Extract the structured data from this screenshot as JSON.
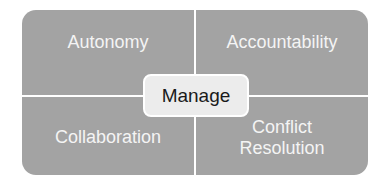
{
  "diagram": {
    "center": {
      "label": "Manage"
    },
    "quadrants": [
      {
        "position": "top-left",
        "label": "Autonomy"
      },
      {
        "position": "top-right",
        "label": "Accountability"
      },
      {
        "position": "bottom-left",
        "label": "Collaboration"
      },
      {
        "position": "bottom-right",
        "label": "Conflict Resolution"
      }
    ],
    "colors": {
      "quadrant_fill": "#a3a3a3",
      "quadrant_text": "#f4f4f4",
      "center_fill": "#ececec",
      "center_text": "#1a1a1a",
      "divider": "#ffffff"
    }
  }
}
